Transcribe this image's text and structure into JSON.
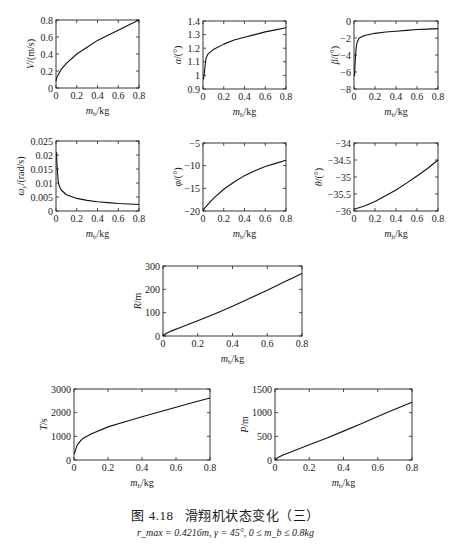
{
  "figure": {
    "caption_number": "图 4.18",
    "caption_title": "滑翔机状态变化（三）",
    "subcaption": "r_max = 0.4216m, γ = 45°, 0 ≤ m_b ≤ 0.8kg"
  },
  "chart_data": [
    {
      "id": "V",
      "type": "line",
      "title": "",
      "xlabel": "m_b/kg",
      "ylabel": "V/(m/s)",
      "xlim": [
        0,
        0.8
      ],
      "ylim": [
        0,
        0.8
      ],
      "xticks": [
        "0",
        "0.2",
        "0.4",
        "0.6",
        "0.8"
      ],
      "yticks": [
        "0",
        "0.2",
        "0.4",
        "0.6",
        "0.8"
      ],
      "x": [
        0,
        0.01,
        0.05,
        0.1,
        0.2,
        0.3,
        0.4,
        0.5,
        0.6,
        0.7,
        0.8
      ],
      "y": [
        0.08,
        0.13,
        0.22,
        0.29,
        0.4,
        0.48,
        0.56,
        0.62,
        0.68,
        0.74,
        0.8
      ]
    },
    {
      "id": "alpha",
      "type": "line",
      "xlabel": "m_b/kg",
      "ylabel": "α/(°)",
      "xlim": [
        0,
        0.8
      ],
      "ylim": [
        0.9,
        1.4
      ],
      "xticks": [
        "0",
        "0.2",
        "0.4",
        "0.6",
        "0.8"
      ],
      "yticks": [
        "0.9",
        "1",
        "1.1",
        "1.2",
        "1.3",
        "1.4"
      ],
      "x": [
        0.005,
        0.01,
        0.02,
        0.03,
        0.05,
        0.1,
        0.2,
        0.3,
        0.4,
        0.5,
        0.6,
        0.7,
        0.8
      ],
      "y": [
        0.97,
        1.0,
        1.07,
        1.13,
        1.16,
        1.19,
        1.23,
        1.26,
        1.28,
        1.3,
        1.32,
        1.335,
        1.35
      ]
    },
    {
      "id": "beta",
      "type": "line",
      "xlabel": "m_b/kg",
      "ylabel": "β/(°)",
      "xlim": [
        0,
        0.8
      ],
      "ylim": [
        -8,
        0
      ],
      "xticks": [
        "0",
        "0.2",
        "0.4",
        "0.6",
        "0.8"
      ],
      "yticks": [
        "-8",
        "-6",
        "-4",
        "-2",
        "0"
      ],
      "x": [
        0.005,
        0.01,
        0.02,
        0.03,
        0.05,
        0.1,
        0.2,
        0.3,
        0.4,
        0.5,
        0.6,
        0.7,
        0.8
      ],
      "y": [
        -6.5,
        -5.0,
        -3.2,
        -2.5,
        -2.0,
        -1.7,
        -1.45,
        -1.3,
        -1.2,
        -1.1,
        -1.0,
        -0.95,
        -0.9
      ]
    },
    {
      "id": "omega",
      "type": "line",
      "xlabel": "m_b/kg",
      "ylabel": "ω_y/(rad/s)",
      "xlim": [
        0,
        0.8
      ],
      "ylim": [
        0,
        0.025
      ],
      "xticks": [
        "0",
        "0.2",
        "0.4",
        "0.6",
        "0.8"
      ],
      "yticks": [
        "0",
        "0.005",
        "0.01",
        "0.015",
        "0.02",
        "0.025"
      ],
      "x": [
        0.005,
        0.01,
        0.02,
        0.03,
        0.05,
        0.1,
        0.2,
        0.3,
        0.4,
        0.5,
        0.6,
        0.7,
        0.8
      ],
      "y": [
        0.021,
        0.016,
        0.011,
        0.009,
        0.0075,
        0.0058,
        0.0045,
        0.0038,
        0.0033,
        0.003,
        0.0027,
        0.0025,
        0.0023
      ]
    },
    {
      "id": "phi",
      "type": "line",
      "xlabel": "m_b/kg",
      "ylabel": "φ/(°)",
      "xlim": [
        0,
        0.8
      ],
      "ylim": [
        -20,
        -5
      ],
      "xticks": [
        "0",
        "0.2",
        "0.4",
        "0.6",
        "0.8"
      ],
      "yticks": [
        "-20",
        "-15",
        "-10",
        "-5"
      ],
      "x": [
        0,
        0.05,
        0.1,
        0.2,
        0.3,
        0.4,
        0.5,
        0.6,
        0.7,
        0.8
      ],
      "y": [
        -19.8,
        -18.5,
        -17.2,
        -15.2,
        -13.6,
        -12.2,
        -11.1,
        -10.2,
        -9.5,
        -8.8
      ]
    },
    {
      "id": "theta",
      "type": "line",
      "xlabel": "m_b/kg",
      "ylabel": "θ/(°)",
      "xlim": [
        0,
        0.8
      ],
      "ylim": [
        -36,
        -34
      ],
      "xticks": [
        "0",
        "0.2",
        "0.4",
        "0.6",
        "0.8"
      ],
      "yticks": [
        "-36",
        "-35.5",
        "-35",
        "-34.5",
        "-34"
      ],
      "x": [
        0,
        0.1,
        0.2,
        0.3,
        0.4,
        0.5,
        0.6,
        0.7,
        0.8
      ],
      "y": [
        -35.95,
        -35.85,
        -35.72,
        -35.55,
        -35.38,
        -35.18,
        -34.97,
        -34.75,
        -34.5
      ]
    },
    {
      "id": "R",
      "type": "line",
      "xlabel": "m_b/kg",
      "ylabel": "R/m",
      "xlim": [
        0,
        0.8
      ],
      "ylim": [
        0,
        300
      ],
      "xticks": [
        "0",
        "0.2",
        "0.4",
        "0.6",
        "0.8"
      ],
      "yticks": [
        "0",
        "100",
        "200",
        "300"
      ],
      "x": [
        0,
        0.02,
        0.05,
        0.1,
        0.2,
        0.3,
        0.4,
        0.5,
        0.6,
        0.7,
        0.8
      ],
      "y": [
        0,
        12,
        22,
        36,
        65,
        95,
        128,
        162,
        196,
        232,
        268
      ]
    },
    {
      "id": "T",
      "type": "line",
      "xlabel": "m_b/kg",
      "ylabel": "T/s",
      "xlim": [
        0,
        0.8
      ],
      "ylim": [
        0,
        3000
      ],
      "xticks": [
        "0",
        "0.2",
        "0.4",
        "0.6",
        "0.8"
      ],
      "yticks": [
        "0",
        "1000",
        "2000",
        "3000"
      ],
      "x": [
        0.002,
        0.01,
        0.02,
        0.05,
        0.1,
        0.2,
        0.3,
        0.4,
        0.5,
        0.6,
        0.7,
        0.8
      ],
      "y": [
        250,
        450,
        650,
        900,
        1100,
        1400,
        1620,
        1830,
        2030,
        2230,
        2430,
        2620
      ]
    },
    {
      "id": "P",
      "type": "line",
      "xlabel": "m_b/kg",
      "ylabel": "P/m",
      "xlim": [
        0,
        0.8
      ],
      "ylim": [
        0,
        1500
      ],
      "xticks": [
        "0",
        "0.2",
        "0.4",
        "0.6",
        "0.8"
      ],
      "yticks": [
        "0",
        "500",
        "1000",
        "1500"
      ],
      "x": [
        0,
        0.02,
        0.05,
        0.1,
        0.2,
        0.3,
        0.4,
        0.5,
        0.6,
        0.7,
        0.8
      ],
      "y": [
        0,
        60,
        110,
        180,
        320,
        460,
        610,
        760,
        920,
        1070,
        1220
      ]
    }
  ]
}
